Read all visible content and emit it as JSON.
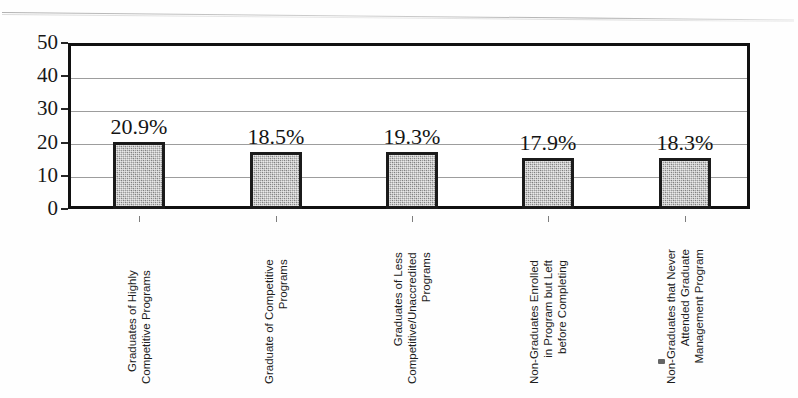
{
  "chart_data": {
    "type": "bar",
    "title": "",
    "xlabel": "",
    "ylabel": "",
    "ylim": [
      0,
      50
    ],
    "ytick_values": [
      50,
      40,
      30,
      20,
      10,
      0
    ],
    "ytick_labels": [
      "50",
      "40",
      "30",
      "20",
      "10",
      "0"
    ],
    "grid": true,
    "legend": "none",
    "categories": [
      "Graduates of Highly Competitive Programs",
      "Graduate of Competitive Programs",
      "Graduates of Less Competitive/Unaccredited Programs",
      "Non-Graduates Enrolled in Program but Left before Completing",
      "Non-Graduates that Never Attended Graduate Management Program"
    ],
    "category_lines": [
      [
        "Graduates of Highly",
        "Competitive Programs"
      ],
      [
        "Graduate of Competitive",
        "Programs"
      ],
      [
        "Graduates of Less",
        "Competitive/Unaccredited",
        "Programs"
      ],
      [
        "Non-Graduates Enrolled",
        "in Program but Left",
        "before Completing"
      ],
      [
        "Non-Graduates that Never",
        "Attended Graduate",
        "Management Program"
      ]
    ],
    "values": [
      20.2,
      17.2,
      17.2,
      15.4,
      15.4
    ],
    "data_labels": [
      "20.9%",
      "18.5%",
      "19.3%",
      "17.9%",
      "18.3%"
    ],
    "bar_color": "#9c9c9c",
    "bar_edge_color": "#1b1b1b",
    "gridline_color": "#9d9d9d",
    "axis_color": "#111111"
  }
}
